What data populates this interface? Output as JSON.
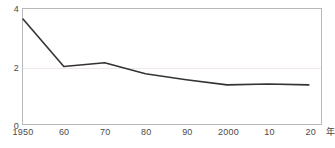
{
  "chart_data": {
    "type": "line",
    "title": "",
    "subtitle": "",
    "xlabel": "年",
    "ylabel": "",
    "grid": true,
    "legend": false,
    "legend_position": "none",
    "xlim": [
      1950,
      2023
    ],
    "ylim": [
      0,
      4
    ],
    "x": [
      1950,
      1960,
      1970,
      1980,
      1990,
      2000,
      2010,
      2020
    ],
    "x_tick_labels": [
      "1950",
      "60",
      "70",
      "80",
      "90",
      "2000",
      "10",
      "20"
    ],
    "y_ticks": [
      0,
      2,
      4
    ],
    "y_tick_labels": [
      "0",
      "2",
      "4"
    ],
    "gridline_values": [
      2
    ],
    "series": [
      {
        "name": "",
        "color": "#333333",
        "values": [
          3.65,
          2.0,
          2.13,
          1.75,
          1.54,
          1.36,
          1.39,
          1.36
        ]
      }
    ]
  },
  "axes": {
    "x_unit_label": "年",
    "y_tick_0": "0",
    "y_tick_2": "2",
    "y_tick_4": "4",
    "x_tick_1950": "1950",
    "x_tick_1960": "60",
    "x_tick_1970": "70",
    "x_tick_1980": "80",
    "x_tick_1990": "90",
    "x_tick_2000": "2000",
    "x_tick_2010": "10",
    "x_tick_2020": "20"
  },
  "colors": {
    "line": "#333333",
    "frame": "#b9b9b9",
    "grid": "#efe7e7",
    "text": "#4a4a4a",
    "background": "#ffffff"
  }
}
